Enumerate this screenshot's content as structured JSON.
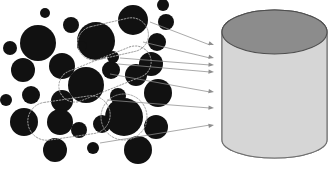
{
  "figure": {
    "type": "diagram",
    "width": 335,
    "height": 169,
    "background_color": "#ffffff"
  },
  "colors": {
    "particle_fill": "#111111",
    "outline_stroke": "#9a9a9a",
    "arrow_stroke": "#8e8e8e",
    "cylinder_body_fill": "#d6d6d6",
    "cylinder_body_stroke": "#6f6f6f",
    "cylinder_top_fill": "#8c8c8c",
    "cylinder_top_stroke": "#4e4e4e"
  },
  "particle_cluster": {
    "label": "particle-cluster",
    "count": 31,
    "particles": [
      {
        "cx": 38,
        "cy": 43,
        "r": 18
      },
      {
        "cx": 71,
        "cy": 25,
        "r": 8
      },
      {
        "cx": 96,
        "cy": 41,
        "r": 19
      },
      {
        "cx": 82,
        "cy": 46,
        "r": 5
      },
      {
        "cx": 133,
        "cy": 20,
        "r": 15
      },
      {
        "cx": 157,
        "cy": 42,
        "r": 9
      },
      {
        "cx": 23,
        "cy": 70,
        "r": 12
      },
      {
        "cx": 62,
        "cy": 66,
        "r": 13
      },
      {
        "cx": 111,
        "cy": 70,
        "r": 9
      },
      {
        "cx": 136,
        "cy": 75,
        "r": 11
      },
      {
        "cx": 151,
        "cy": 64,
        "r": 12
      },
      {
        "cx": 31,
        "cy": 95,
        "r": 9
      },
      {
        "cx": 86,
        "cy": 85,
        "r": 18
      },
      {
        "cx": 62,
        "cy": 101,
        "r": 11
      },
      {
        "cx": 118,
        "cy": 96,
        "r": 8
      },
      {
        "cx": 158,
        "cy": 93,
        "r": 14
      },
      {
        "cx": 24,
        "cy": 122,
        "r": 14
      },
      {
        "cx": 60,
        "cy": 122,
        "r": 13
      },
      {
        "cx": 79,
        "cy": 130,
        "r": 8
      },
      {
        "cx": 102,
        "cy": 124,
        "r": 9
      },
      {
        "cx": 124,
        "cy": 117,
        "r": 19
      },
      {
        "cx": 156,
        "cy": 127,
        "r": 12
      },
      {
        "cx": 55,
        "cy": 150,
        "r": 12
      },
      {
        "cx": 93,
        "cy": 148,
        "r": 6
      },
      {
        "cx": 138,
        "cy": 150,
        "r": 14
      },
      {
        "cx": 10,
        "cy": 48,
        "r": 7
      },
      {
        "cx": 6,
        "cy": 100,
        "r": 6
      },
      {
        "cx": 166,
        "cy": 22,
        "r": 8
      },
      {
        "cx": 163,
        "cy": 5,
        "r": 6
      },
      {
        "cx": 113,
        "cy": 57,
        "r": 6
      },
      {
        "cx": 45,
        "cy": 13,
        "r": 5
      }
    ]
  },
  "grouping_outlines": {
    "label": "dotted-grouping-outlines",
    "count": 4,
    "shapes": [
      {
        "name": "capsule-top",
        "type": "capsule",
        "x1": 78,
        "y1": 47,
        "x2": 148,
        "y2": 31,
        "r": 17
      },
      {
        "name": "capsule-mid",
        "type": "capsule",
        "x1": 60,
        "y1": 92,
        "x2": 150,
        "y2": 56,
        "r": 16
      },
      {
        "name": "capsule-lower-left",
        "type": "capsule",
        "x1": 28,
        "y1": 124,
        "x2": 110,
        "y2": 112,
        "r": 19
      },
      {
        "name": "circle-right",
        "type": "circle",
        "cx": 124,
        "cy": 117,
        "r": 23
      }
    ]
  },
  "flow_arrows": {
    "label": "upscaling-arrows",
    "count": 7,
    "direction": "left-to-right",
    "arrows": [
      {
        "x1": 150,
        "y1": 22,
        "x2": 214,
        "y2": 45
      },
      {
        "x1": 143,
        "y1": 42,
        "x2": 214,
        "y2": 58
      },
      {
        "x1": 120,
        "y1": 58,
        "x2": 214,
        "y2": 65
      },
      {
        "x1": 118,
        "y1": 64,
        "x2": 214,
        "y2": 72
      },
      {
        "x1": 110,
        "y1": 74,
        "x2": 214,
        "y2": 92
      },
      {
        "x1": 107,
        "y1": 100,
        "x2": 214,
        "y2": 108
      },
      {
        "x1": 100,
        "y1": 143,
        "x2": 214,
        "y2": 125
      }
    ]
  },
  "cylinder": {
    "label": "representative-volume-cylinder",
    "left": 222,
    "right": 327,
    "top_ellipse_cy": 32,
    "top_ellipse_ry": 22,
    "bottom_ellipse_cy": 140,
    "bottom_ellipse_ry": 18,
    "texture": "fine diagonal hatch"
  }
}
